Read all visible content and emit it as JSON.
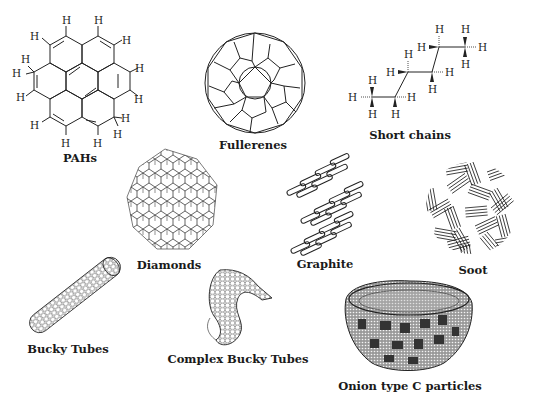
{
  "items": [
    {
      "id": "pahs",
      "label": "PAHs",
      "icon": "pah-molecule-icon"
    },
    {
      "id": "fullerenes",
      "label": "Fullerenes",
      "icon": "fullerene-icon"
    },
    {
      "id": "short_chains",
      "label": "Short chains",
      "icon": "short-chain-hydrocarbon-icon"
    },
    {
      "id": "diamonds",
      "label": "Diamonds",
      "icon": "diamond-lattice-icon"
    },
    {
      "id": "graphite",
      "label": "Graphite",
      "icon": "graphite-layers-icon"
    },
    {
      "id": "soot",
      "label": "Soot",
      "icon": "soot-particle-icon"
    },
    {
      "id": "bucky_tubes",
      "label": "Bucky Tubes",
      "icon": "bucky-tube-icon"
    },
    {
      "id": "complex_bucky_tubes",
      "label": "Complex Bucky Tubes",
      "icon": "complex-bucky-tube-icon"
    },
    {
      "id": "onion",
      "label": "Onion type C particles",
      "icon": "onion-carbon-particle-icon"
    }
  ],
  "atom_label": "H"
}
